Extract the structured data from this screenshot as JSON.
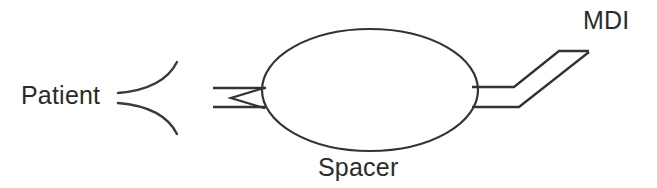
{
  "figure": {
    "background_color": "#ffffff",
    "line_color": "#333333",
    "text_color": "#2b2b2b"
  },
  "labels": {
    "patient": "Patient",
    "spacer": "Spacer",
    "mdi": "MDI"
  },
  "parts": {
    "mouthpiece": "patient-mouthpiece-flare",
    "valve": "one-way-valve",
    "tube_left": "patient-side-tube",
    "chamber": "spacer-chamber-ellipse",
    "tube_right": "mdi-side-tube",
    "port": "mdi-canister-port"
  },
  "geometry": {
    "chamber_center_x": 370,
    "chamber_center_y": 90,
    "chamber_radius_x": 108,
    "chamber_radius_y": 61,
    "tube_top_y": 88,
    "tube_bottom_y": 107,
    "tube_left_start_x": 213,
    "valve_apex_x": 232,
    "valve_apex_y": 98,
    "tube_right_bend_x": 513,
    "port_tip_x": 588,
    "port_tip_y": 51
  }
}
